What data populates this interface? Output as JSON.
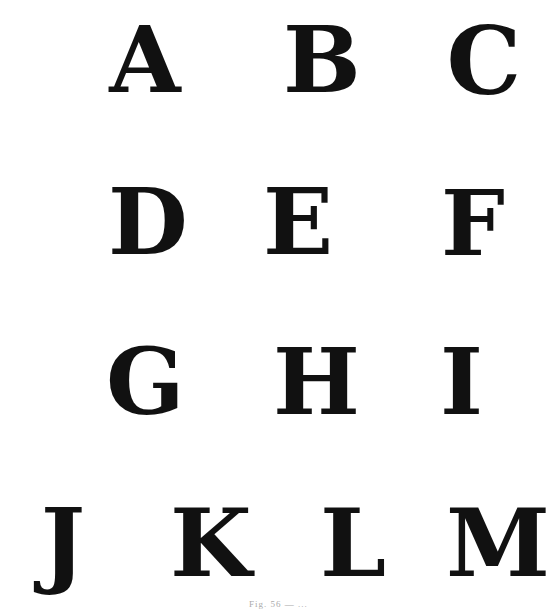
{
  "plate": {
    "rows": [
      [
        "A",
        "B",
        "C"
      ],
      [
        "D",
        "E",
        "F"
      ],
      [
        "G",
        "H",
        "I"
      ],
      [
        "J",
        "K",
        "L",
        "M"
      ]
    ],
    "letters": [
      {
        "char": "A",
        "x": 102,
        "y": 18,
        "w": 86,
        "h": 72
      },
      {
        "char": "B",
        "x": 283,
        "y": 18,
        "w": 70,
        "h": 72
      },
      {
        "char": "C",
        "x": 445,
        "y": 18,
        "w": 78,
        "h": 75
      },
      {
        "char": "D",
        "x": 108,
        "y": 180,
        "w": 78,
        "h": 72
      },
      {
        "char": "E",
        "x": 263,
        "y": 180,
        "w": 66,
        "h": 72
      },
      {
        "char": "F",
        "x": 441,
        "y": 182,
        "w": 56,
        "h": 70
      },
      {
        "char": "G",
        "x": 106,
        "y": 340,
        "w": 76,
        "h": 72
      },
      {
        "char": "H",
        "x": 273,
        "y": 340,
        "w": 78,
        "h": 72
      },
      {
        "char": "I",
        "x": 440,
        "y": 340,
        "w": 40,
        "h": 72
      },
      {
        "char": "J",
        "x": 34,
        "y": 500,
        "w": 58,
        "h": 74
      },
      {
        "char": "K",
        "x": 170,
        "y": 500,
        "w": 80,
        "h": 74
      },
      {
        "char": "L",
        "x": 318,
        "y": 500,
        "w": 70,
        "h": 74
      },
      {
        "char": "M",
        "x": 446,
        "y": 500,
        "w": 86,
        "h": 74
      }
    ],
    "caption": "Fig. 56 — ..."
  }
}
